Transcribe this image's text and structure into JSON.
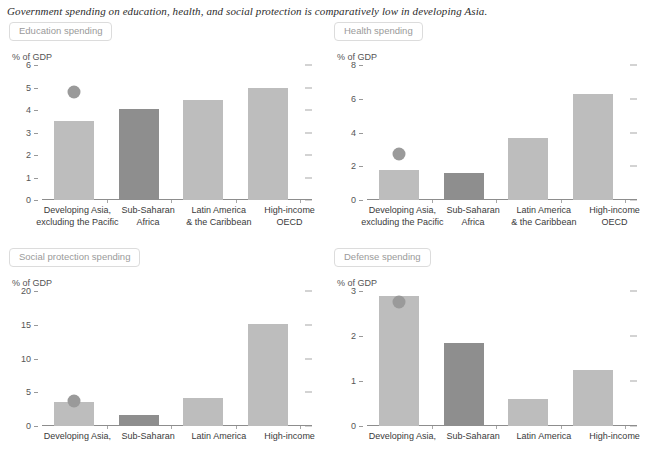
{
  "title": "Government spending on education, health, and social protection is comparatively low in developing Asia.",
  "colors": {
    "bar_light": "#bdbdbd",
    "bar_dark": "#8e8e8e",
    "marker": "#9a9a9a",
    "axis": "#8d8d8d",
    "tab_border": "#dcdcdc",
    "tab_text": "#9a9a9a"
  },
  "panels": [
    {
      "tab_label": "Education spending",
      "unit_label": "% of GDP",
      "chart_data": {
        "type": "bar",
        "title": "Education spending",
        "xlabel": "",
        "ylabel": "% of GDP",
        "ylim": [
          0,
          6
        ],
        "yticks": [
          0,
          1,
          2,
          3,
          4,
          5,
          6
        ],
        "ytick_labels": [
          "0",
          "1",
          "2",
          "3",
          "4",
          "5",
          "6"
        ],
        "grid": false,
        "legend": "none",
        "categories": [
          "Developing Asia, excluding the Pacific",
          "Sub-Saharan Africa",
          "Latin America & the Caribbean",
          "High-income OECD"
        ],
        "category_lines": [
          [
            "Developing Asia,",
            "excluding the Pacific"
          ],
          [
            "Sub-Saharan",
            "Africa"
          ],
          [
            "Latin America",
            "& the Caribbean"
          ],
          [
            "High-income",
            "OECD"
          ]
        ],
        "values": [
          3.5,
          4.05,
          4.45,
          5.0
        ],
        "bar_shades": [
          "light",
          "dark",
          "light",
          "light"
        ],
        "markers": [
          {
            "category_index": 0,
            "value": 4.8
          }
        ]
      }
    },
    {
      "tab_label": "Health spending",
      "unit_label": "% of GDP",
      "chart_data": {
        "type": "bar",
        "title": "Health spending",
        "xlabel": "",
        "ylabel": "% of GDP",
        "ylim": [
          0,
          8
        ],
        "yticks": [
          0,
          2,
          4,
          6,
          8
        ],
        "ytick_labels": [
          "0",
          "2",
          "4",
          "6",
          "8"
        ],
        "grid": false,
        "legend": "none",
        "categories": [
          "Developing Asia, excluding the Pacific",
          "Sub-Saharan Africa",
          "Latin America & the Caribbean",
          "High-income OECD"
        ],
        "category_lines": [
          [
            "Developing Asia,",
            "excluding the Pacific"
          ],
          [
            "Sub-Saharan",
            "Africa"
          ],
          [
            "Latin America",
            "& the Caribbean"
          ],
          [
            "High-income",
            "OECD"
          ]
        ],
        "values": [
          1.75,
          1.6,
          3.7,
          6.3
        ],
        "bar_shades": [
          "light",
          "dark",
          "light",
          "light"
        ],
        "markers": [
          {
            "category_index": 0,
            "value": 2.75
          }
        ]
      }
    },
    {
      "tab_label": "Social protection spending",
      "unit_label": "% of GDP",
      "chart_data": {
        "type": "bar",
        "title": "Social protection spending",
        "xlabel": "",
        "ylabel": "% of GDP",
        "ylim": [
          0,
          20
        ],
        "yticks": [
          0,
          5,
          10,
          15,
          20
        ],
        "ytick_labels": [
          "0",
          "5",
          "10",
          "15",
          "20"
        ],
        "grid": false,
        "legend": "none",
        "categories": [
          "Developing Asia,",
          "Sub-Saharan",
          "Latin America",
          "High-income"
        ],
        "category_lines": [
          [
            "Developing Asia,"
          ],
          [
            "Sub-Saharan"
          ],
          [
            "Latin America"
          ],
          [
            "High-income"
          ]
        ],
        "values": [
          3.5,
          1.7,
          4.2,
          15.1
        ],
        "bar_shades": [
          "light",
          "dark",
          "light",
          "light"
        ],
        "markers": [
          {
            "category_index": 0,
            "value": 3.7
          }
        ]
      }
    },
    {
      "tab_label": "Defense spending",
      "unit_label": "% of GDP",
      "chart_data": {
        "type": "bar",
        "title": "Defense spending",
        "xlabel": "",
        "ylabel": "% of GDP",
        "ylim": [
          0,
          3
        ],
        "yticks": [
          0,
          1,
          2,
          3
        ],
        "ytick_labels": [
          "0",
          "1",
          "2",
          "3"
        ],
        "grid": false,
        "legend": "none",
        "categories": [
          "Developing Asia,",
          "Sub-Saharan",
          "Latin America",
          "High-income"
        ],
        "category_lines": [
          [
            "Developing Asia,"
          ],
          [
            "Sub-Saharan"
          ],
          [
            "Latin America"
          ],
          [
            "High-income"
          ]
        ],
        "values": [
          2.9,
          1.85,
          0.6,
          1.25
        ],
        "bar_shades": [
          "light",
          "dark",
          "light",
          "light"
        ],
        "markers": [
          {
            "category_index": 0,
            "value": 2.75
          }
        ]
      }
    }
  ]
}
